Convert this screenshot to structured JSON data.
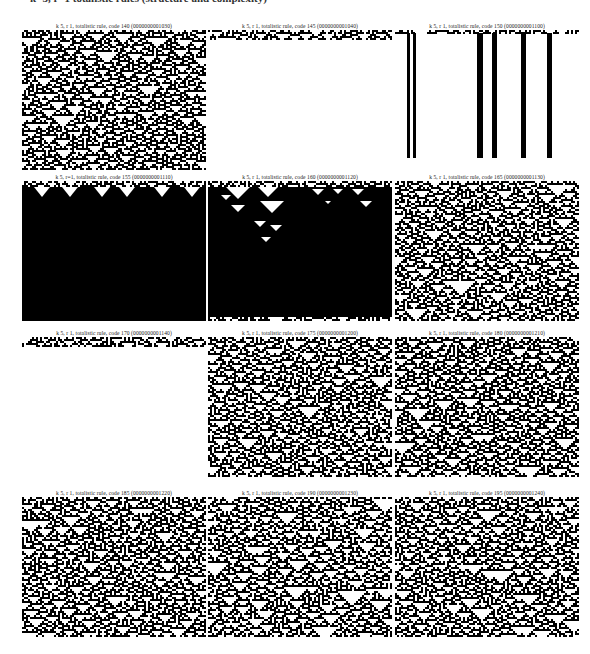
{
  "header": {
    "text": "k=5, r=1 totalistic rules (structure and complexity)"
  },
  "panels": [
    {
      "title": "k 5, r 1, totalistic rule, code 140 (0000000001030)",
      "code": 140,
      "style": "dense"
    },
    {
      "title": "k 5, r 1, totalistic rule, code 145 (0000000001040)",
      "code": 145,
      "style": "dies"
    },
    {
      "title": "k 5, r 1, totalistic rule, code 150 (0000000001100)",
      "code": 150,
      "style": "stripes"
    },
    {
      "title": "k 5, r=1, totalistic rule, code 155 (0000000001110)",
      "code": 155,
      "style": "black"
    },
    {
      "title": "k 5, r 1, totalistic rule, code 160 (0000000001120)",
      "code": 160,
      "style": "black-triangles"
    },
    {
      "title": "k 5, r 1, totalistic rule, code 165 (0000000001130)",
      "code": 165,
      "style": "sparse"
    },
    {
      "title": "k 5, r 1, totalistic rule, code 170 (0000000001140)",
      "code": 170,
      "style": "dies"
    },
    {
      "title": "k 5, r 1, totalistic rule, code 175 (0000000001200)",
      "code": 175,
      "style": "sparse"
    },
    {
      "title": "k 5, r 1, totalistic rule, code 180 (0000000001210)",
      "code": 180,
      "style": "dense"
    },
    {
      "title": "k 5, r 1, totalistic rule, code 185 (0000000001220)",
      "code": 185,
      "style": "medium"
    },
    {
      "title": "k 5, r 1, totalistic rule, code 190 (0000000001230)",
      "code": 190,
      "style": "sparse"
    },
    {
      "title": "k 5, r 1, totalistic rule, code 195 (0000000001240)",
      "code": 195,
      "style": "sparse"
    }
  ],
  "colors": {
    "ink": "#000000",
    "paper": "#ffffff"
  }
}
